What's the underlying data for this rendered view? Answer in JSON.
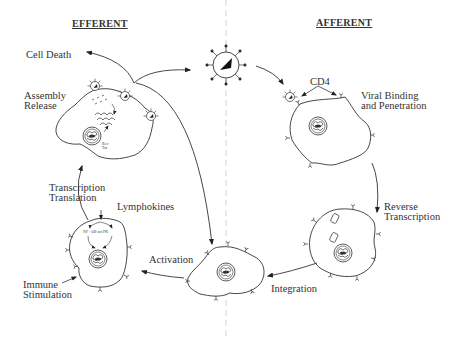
{
  "headers": {
    "left": "EFFERENT",
    "right": "AFFERENT"
  },
  "labels": {
    "cell_death": "Cell Death",
    "assembly_release": "Assembly\nRelease",
    "cd4": "CD4",
    "viral_binding": "Viral Binding\nand Penetration",
    "reverse_transcription": "Reverse\nTranscription",
    "integration": "Integration",
    "activation": "Activation",
    "lymphokines": "Lymphokines",
    "transcription_translation": "Transcription\nTranslation",
    "immune_stimulation": "Immune\nStimulation",
    "rev_tat": "Rev\nTat",
    "nf_kb": "NF - kB-act PK"
  },
  "stages": [
    "Viral Binding and Penetration",
    "Reverse Transcription",
    "Integration",
    "Activation",
    "Immune Stimulation",
    "Transcription Translation",
    "Assembly Release",
    "Cell Death"
  ],
  "colors": {
    "line": "#333333",
    "divider": "#c8c8c8",
    "background": "#ffffff"
  }
}
